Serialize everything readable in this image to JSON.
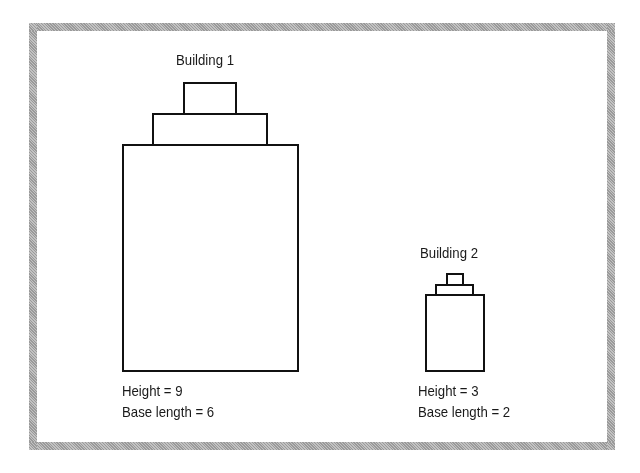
{
  "buildings": [
    {
      "title": "Building 1",
      "height_label": "Height = 9",
      "base_label": "Base length = 6"
    },
    {
      "title": "Building 2",
      "height_label": "Height = 3",
      "base_label": "Base length = 2"
    }
  ],
  "colors": {
    "frame": "#a8a8a8",
    "stroke": "#111111",
    "background": "#ffffff"
  }
}
